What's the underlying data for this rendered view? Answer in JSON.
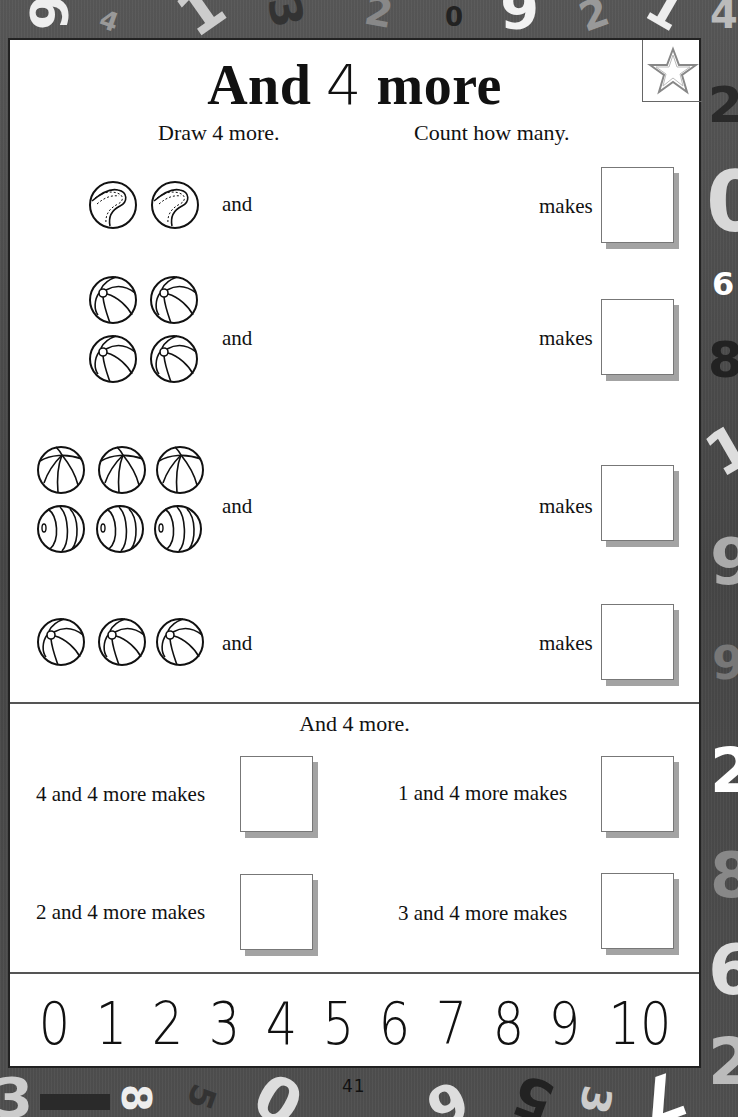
{
  "page": {
    "title_pre": "And ",
    "title_digit": "4",
    "title_post": " more",
    "star_icon": "star-outline-icon",
    "page_number": "41"
  },
  "instructions": {
    "left": "Draw 4 more.",
    "right": "Count how many."
  },
  "exercises": [
    {
      "ball_type": "baseball",
      "ball_count": 2,
      "rows": [
        2
      ],
      "and_label": "and",
      "makes_label": "makes",
      "answer": ""
    },
    {
      "ball_type": "beach-ball",
      "ball_count": 4,
      "rows": [
        2,
        2
      ],
      "and_label": "and",
      "makes_label": "makes",
      "answer": ""
    },
    {
      "ball_type": "beach-ball-and-striped-ball",
      "ball_count": 6,
      "rows": [
        3,
        3
      ],
      "and_label": "and",
      "makes_label": "makes",
      "answer": ""
    },
    {
      "ball_type": "beach-ball",
      "ball_count": 3,
      "rows": [
        3
      ],
      "and_label": "and",
      "makes_label": "makes",
      "answer": ""
    }
  ],
  "section2": {
    "heading": "And 4 more.",
    "sentences": [
      {
        "text": "4 and 4 more makes",
        "answer": ""
      },
      {
        "text": "1 and 4 more makes",
        "answer": ""
      },
      {
        "text": "2 and 4 more makes",
        "answer": ""
      },
      {
        "text": "3 and 4 more makes",
        "answer": ""
      }
    ]
  },
  "number_line": [
    "0",
    "1",
    "2",
    "3",
    "4",
    "5",
    "6",
    "7",
    "8",
    "9",
    "10"
  ],
  "background_digits": {
    "top": [
      "6",
      "4",
      "1",
      "3",
      "2",
      "0",
      "6",
      "2",
      "1",
      "4"
    ],
    "right": [
      "2",
      "0",
      "6",
      "8",
      "1",
      "9",
      "9",
      "2",
      "8",
      "6",
      "2"
    ],
    "bottom": [
      "3",
      "8",
      "5",
      "0",
      "6",
      "5",
      "3",
      "7"
    ]
  },
  "colors": {
    "border_bg": "#4a4a4a",
    "panel": "#ffffff",
    "box_shadow": "#a3a3a3",
    "text": "#111111"
  }
}
